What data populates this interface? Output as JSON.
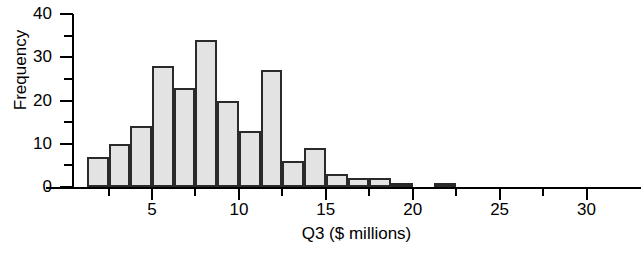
{
  "chart_data": {
    "type": "bar",
    "title": "",
    "subtitle": "",
    "xlabel": "Q3 ($ millions)",
    "ylabel": "Frequency",
    "xlim": [
      0,
      30
    ],
    "ylim": [
      0,
      40
    ],
    "grid": false,
    "legend": null,
    "bin_width": 1.25,
    "x_major_ticks": [
      5,
      10,
      15,
      20,
      25,
      30
    ],
    "x_major_tick_labels": [
      "5",
      "10",
      "15",
      "20",
      "25",
      "30"
    ],
    "x_minor_ticks": [
      2.5,
      7.5,
      12.5,
      17.5,
      22.5,
      27.5
    ],
    "y_major_ticks": [
      0,
      10,
      20,
      30,
      40
    ],
    "y_major_tick_labels": [
      "0",
      "10",
      "20",
      "30",
      "40"
    ],
    "y_minor_ticks": [
      5,
      15,
      25,
      35
    ],
    "bins": [
      {
        "left": 1.25,
        "right": 2.5,
        "value": 7
      },
      {
        "left": 2.5,
        "right": 3.75,
        "value": 10
      },
      {
        "left": 3.75,
        "right": 5.0,
        "value": 14
      },
      {
        "left": 5.0,
        "right": 6.25,
        "value": 28
      },
      {
        "left": 6.25,
        "right": 7.5,
        "value": 23
      },
      {
        "left": 7.5,
        "right": 8.75,
        "value": 34
      },
      {
        "left": 8.75,
        "right": 10.0,
        "value": 20
      },
      {
        "left": 10.0,
        "right": 11.25,
        "value": 13
      },
      {
        "left": 11.25,
        "right": 12.5,
        "value": 27
      },
      {
        "left": 12.5,
        "right": 13.75,
        "value": 6
      },
      {
        "left": 13.75,
        "right": 15.0,
        "value": 9
      },
      {
        "left": 15.0,
        "right": 16.25,
        "value": 3
      },
      {
        "left": 16.25,
        "right": 17.5,
        "value": 2
      },
      {
        "left": 17.5,
        "right": 18.75,
        "value": 2
      },
      {
        "left": 18.75,
        "right": 20.0,
        "value": 1
      },
      {
        "left": 20.0,
        "right": 21.25,
        "value": 0
      },
      {
        "left": 21.25,
        "right": 22.5,
        "value": 1
      }
    ],
    "values": [
      7,
      10,
      14,
      28,
      23,
      34,
      20,
      13,
      27,
      6,
      9,
      3,
      2,
      2,
      1,
      0,
      1
    ],
    "categories": [
      "1.25-2.5",
      "2.5-3.75",
      "3.75-5",
      "5-6.25",
      "6.25-7.5",
      "7.5-8.75",
      "8.75-10",
      "10-11.25",
      "11.25-12.5",
      "12.5-13.75",
      "13.75-15",
      "15-16.25",
      "16.25-17.5",
      "17.5-18.75",
      "18.75-20",
      "20-21.25",
      "21.25-22.5"
    ],
    "colors": {
      "bar_fill": "#e3e3e3",
      "bar_edge": "#2a2a2a",
      "axis": "#000000",
      "text": "#000000",
      "background": "#ffffff"
    }
  }
}
